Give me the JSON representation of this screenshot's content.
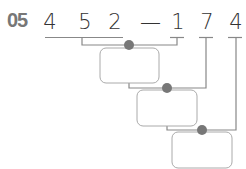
{
  "problem_number": "05",
  "digits": [
    "4",
    "5",
    "2",
    "—",
    "1",
    "7",
    "4"
  ],
  "boxes": [
    {
      "value": ""
    },
    {
      "value": ""
    },
    {
      "value": ""
    }
  ],
  "colors": {
    "line": "#888888",
    "dot": "#777777",
    "box_border": "#aaaaaa",
    "text": "#333333"
  }
}
